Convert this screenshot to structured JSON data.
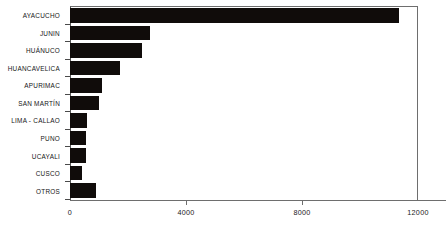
{
  "chart_data": {
    "type": "bar",
    "orientation": "horizontal",
    "title": "",
    "subtitle": "",
    "xlabel": "",
    "ylabel": "",
    "xlim": [
      0,
      12000
    ],
    "ylim": null,
    "grid": false,
    "legend": null,
    "xticks": [
      0,
      4000,
      8000,
      12000
    ],
    "xtick_labels": [
      "0",
      "4000",
      "8000",
      "12000"
    ],
    "categories": [
      "AYACUCHO",
      "JUNIN",
      "HUÁNUCO",
      "HUANCAVELICA",
      "APURIMAC",
      "SAN MARTÍN",
      "LIMA - CALLAO",
      "PUNO",
      "UCAYALI",
      "CUSCO",
      "OTROS"
    ],
    "values": [
      11350,
      2760,
      2480,
      1720,
      1100,
      1000,
      590,
      550,
      550,
      410,
      900
    ],
    "bar_color": "#100c0a",
    "axis_color": "#6e6e6e"
  },
  "colors": {
    "bar": "#100c0a",
    "axis": "#6e6e6e",
    "background": "#ffffff",
    "text": "#151515"
  }
}
